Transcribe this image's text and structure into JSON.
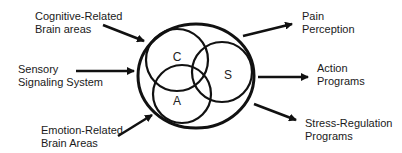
{
  "diagram": {
    "inputs": [
      {
        "id": "cognitive",
        "lines": [
          "Cognitive-Related",
          "Brain areas"
        ]
      },
      {
        "id": "sensory",
        "lines": [
          "Sensory",
          "Signaling System"
        ]
      },
      {
        "id": "emotion",
        "lines": [
          "Emotion-Related",
          "Brain Areas"
        ]
      }
    ],
    "outputs": [
      {
        "id": "pain",
        "lines": [
          "Pain",
          "Perception"
        ]
      },
      {
        "id": "action",
        "lines": [
          "Action",
          "Programs"
        ]
      },
      {
        "id": "stress",
        "lines": [
          "Stress-Regulation",
          "Programs"
        ]
      }
    ],
    "venn": {
      "letters": {
        "c": "C",
        "s": "S",
        "a": "A"
      }
    },
    "colors": {
      "stroke": "#111111",
      "text": "#1a1a1a"
    }
  }
}
